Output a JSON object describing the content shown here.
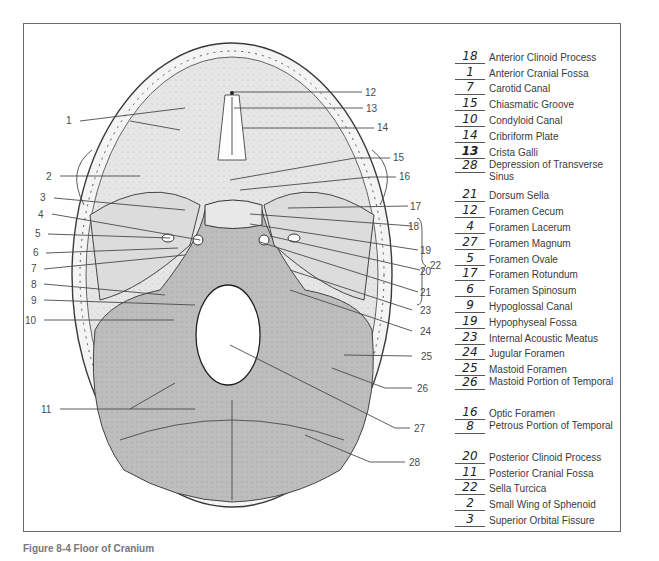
{
  "figure": {
    "caption": "Figure 8-4 Floor of Cranium",
    "colors": {
      "bone_light": "#e4e4e4",
      "bone_dark": "#b9b9b9",
      "foramen": "#ffffff",
      "outline": "#3a3a3a",
      "frame": "#6a6a6a"
    }
  },
  "callouts": {
    "left": [
      "1",
      "2",
      "3",
      "4",
      "5",
      "6",
      "7",
      "8",
      "9",
      "10",
      "11"
    ],
    "right": [
      "12",
      "13",
      "14",
      "15",
      "16",
      "17",
      "18",
      "19",
      "20",
      "21",
      "22",
      "23",
      "24",
      "25",
      "26",
      "27",
      "28"
    ]
  },
  "legend": [
    {
      "answer": "18",
      "term": "Anterior Clinoid Process"
    },
    {
      "answer": "1",
      "term": "Anterior Cranial Fossa"
    },
    {
      "answer": "7",
      "term": "Carotid Canal"
    },
    {
      "answer": "15",
      "term": "Chiasmatic Groove"
    },
    {
      "answer": "10",
      "term": "Condyloid Canal"
    },
    {
      "answer": "14",
      "term": "Cribriform Plate"
    },
    {
      "answer": "13",
      "term": "Crista Galli"
    },
    {
      "answer": "28",
      "term": "Depression of Transverse Sinus"
    },
    {
      "answer": "21",
      "term": "Dorsum Sella"
    },
    {
      "answer": "12",
      "term": "Foramen Cecum"
    },
    {
      "answer": "4",
      "term": "Foramen Lacerum"
    },
    {
      "answer": "27",
      "term": "Foramen Magnum"
    },
    {
      "answer": "5",
      "term": "Foramen Ovale"
    },
    {
      "answer": "17",
      "term": "Foramen Rotundum"
    },
    {
      "answer": "6",
      "term": "Foramen Spinosum"
    },
    {
      "answer": "9",
      "term": "Hypoglossal Canal"
    },
    {
      "answer": "19",
      "term": "Hypophyseal Fossa"
    },
    {
      "answer": "23",
      "term": "Internal Acoustic Meatus"
    },
    {
      "answer": "24",
      "term": "Jugular Foramen"
    },
    {
      "answer": "25",
      "term": "Mastoid Foramen"
    },
    {
      "answer": "26",
      "term": "Mastoid Portion of Temporal"
    },
    {
      "answer": "16",
      "term": "Optic Foramen"
    },
    {
      "answer": "8",
      "term": "Petrous Portion of Temporal"
    },
    {
      "answer": "20",
      "term": "Posterior Clinoid Process"
    },
    {
      "answer": "11",
      "term": "Posterior Cranial Fossa"
    },
    {
      "answer": "22",
      "term": "Sella Turcica"
    },
    {
      "answer": "2",
      "term": "Small Wing of Sphenoid"
    },
    {
      "answer": "3",
      "term": "Superior Orbital Fissure"
    }
  ]
}
